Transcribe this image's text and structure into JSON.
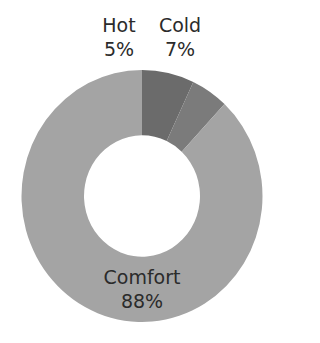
{
  "chart_data": {
    "type": "pie",
    "variant": "donut",
    "title": "",
    "categories": [
      "Cold",
      "Hot",
      "Comfort"
    ],
    "values": [
      7,
      5,
      88
    ],
    "unit": "%",
    "colors": {
      "Cold": "#6b6b6b",
      "Hot": "#7b7b7b",
      "Comfort": "#a4a4a4"
    },
    "start_angle_deg": 0,
    "direction_note": "Cold clockwise from 12 o'clock; Comfort continues; Hot ends at 12 o'clock",
    "legend": "none",
    "data_labels": [
      {
        "name": "Hot",
        "value_label": "5%",
        "position": "outside-top-left"
      },
      {
        "name": "Cold",
        "value_label": "7%",
        "position": "outside-top-right"
      },
      {
        "name": "Comfort",
        "value_label": "88%",
        "position": "inside-bottom"
      }
    ]
  },
  "labels": {
    "hot": {
      "name": "Hot",
      "value": "5%"
    },
    "cold": {
      "name": "Cold",
      "value": "7%"
    },
    "comfort": {
      "name": "Comfort",
      "value": "88%"
    }
  }
}
